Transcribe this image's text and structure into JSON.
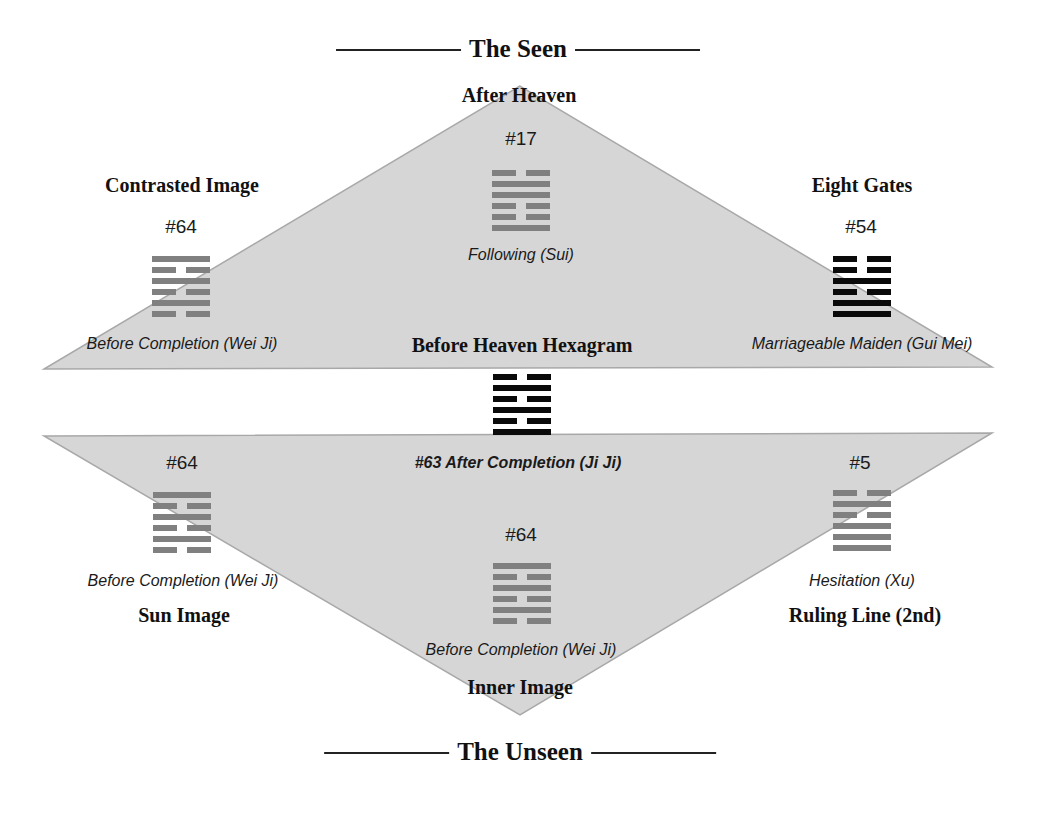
{
  "title_top": "The Seen",
  "title_bottom": "The Unseen",
  "colors": {
    "triangle_fill": "#d6d6d6",
    "triangle_stroke": "#a8a8a8",
    "gray_hexagram": "#808080",
    "black_hexagram": "#0a0a0a"
  },
  "upper_triangle": {
    "apex_label": "After Heaven",
    "base_label": "Before Heaven Hexagram"
  },
  "lower_triangle": {
    "apex_label": "Inner Image"
  },
  "positions": {
    "after_heaven": {
      "number": "#17",
      "name": "Following (Sui)",
      "lines_top_to_bottom": [
        "broken",
        "solid",
        "solid",
        "broken",
        "broken",
        "solid"
      ],
      "style": "gray"
    },
    "contrasted_image": {
      "label": "Contrasted Image",
      "number": "#64",
      "name": "Before Completion (Wei Ji)",
      "lines_top_to_bottom": [
        "solid",
        "broken",
        "solid",
        "broken",
        "solid",
        "broken"
      ],
      "style": "gray"
    },
    "eight_gates": {
      "label": "Eight Gates",
      "number": "#54",
      "name": "Marriageable Maiden (Gui Mei)",
      "lines_top_to_bottom": [
        "broken",
        "broken",
        "solid",
        "broken",
        "solid",
        "solid"
      ],
      "style": "black"
    },
    "before_heaven": {
      "label": "Before Heaven Hexagram",
      "name": "#63 After Completion (Ji Ji)",
      "lines_top_to_bottom": [
        "broken",
        "solid",
        "broken",
        "solid",
        "broken",
        "solid"
      ],
      "style": "black"
    },
    "sun_image": {
      "label": "Sun Image",
      "number": "#64",
      "name": "Before Completion (Wei Ji)",
      "lines_top_to_bottom": [
        "solid",
        "broken",
        "solid",
        "broken",
        "solid",
        "broken"
      ],
      "style": "gray"
    },
    "ruling_line": {
      "label": "Ruling Line (2nd)",
      "number": "#5",
      "name": "Hesitation (Xu)",
      "lines_top_to_bottom": [
        "broken",
        "solid",
        "broken",
        "solid",
        "solid",
        "solid"
      ],
      "style": "gray"
    },
    "inner_image": {
      "label": "Inner Image",
      "number": "#64",
      "name": "Before Completion (Wei Ji)",
      "lines_top_to_bottom": [
        "solid",
        "broken",
        "solid",
        "broken",
        "solid",
        "broken"
      ],
      "style": "gray"
    }
  }
}
